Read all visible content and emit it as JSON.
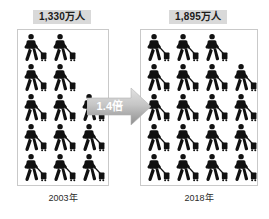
{
  "groups": [
    {
      "id": "2003",
      "count_label": "1,330万人",
      "year_caption": "2003年",
      "rows": [
        2,
        2,
        3,
        3,
        3
      ],
      "total_icons": 13
    },
    {
      "id": "2018",
      "count_label": "1,895万人",
      "year_caption": "2018年",
      "rows": [
        3,
        4,
        4,
        4,
        4
      ],
      "total_icons": 19
    }
  ],
  "arrow": {
    "label": "1.4倍",
    "direction": "right"
  },
  "icons": {
    "traveler": "traveler-with-suitcase-icon"
  },
  "colors": {
    "background": "#ffffff",
    "label_background": "#d9d9d9",
    "label_text": "#1c1c1c",
    "panel_border": "#c9c9c9",
    "pictogram": "#111111",
    "arrow_fill_light": "#d3d3d3",
    "arrow_fill_dark": "#9a9a9a",
    "arrow_text": "#ffffff",
    "caption_text": "#2b2b2b"
  },
  "chart_data": {
    "type": "bar",
    "categories": [
      "2003年",
      "2018年"
    ],
    "values": [
      1330,
      1895
    ],
    "value_labels": [
      "1,330万人",
      "1,895万人"
    ],
    "unit": "万人",
    "icon_counts": [
      13,
      19
    ],
    "growth_factor": "1.4倍",
    "xlabel": "",
    "ylabel": "万人",
    "legend": "none",
    "grid": false
  }
}
